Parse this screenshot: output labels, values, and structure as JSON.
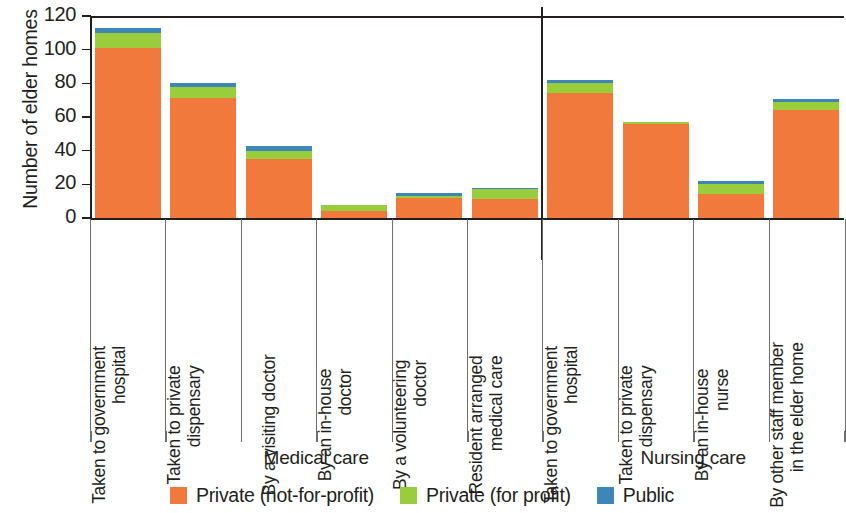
{
  "chart_data": {
    "type": "bar",
    "subtype": "stacked-bar",
    "title": "",
    "xlabel": "",
    "ylabel": "Number of elder homes",
    "ylim": [
      0,
      120
    ],
    "yticks": [
      0,
      20,
      40,
      60,
      80,
      100,
      120
    ],
    "grid": false,
    "legend_position": "bottom-center",
    "categories": [
      "Taken to government hospital",
      "Taken to private dispensary",
      "By a visiting doctor",
      "By an in-house doctor",
      "By a volunteering doctor",
      "Resident arranged medical care",
      "Taken to government hospital",
      "Taken to private dispensary",
      "By an in-house nurse",
      "By other staff member in the elder home"
    ],
    "category_lines": [
      [
        "Taken to government",
        "hospital"
      ],
      [
        "Taken to private",
        "dispensary"
      ],
      [
        "By a visiting doctor"
      ],
      [
        "By an in-house",
        "doctor"
      ],
      [
        "By a volunteering",
        "doctor"
      ],
      [
        "Resident arranged",
        "medical care"
      ],
      [
        "Taken to government",
        "hospital"
      ],
      [
        "Taken to private",
        "dispensary"
      ],
      [
        "By an in-house",
        "nurse"
      ],
      [
        "By other staff member",
        "in the elder home"
      ]
    ],
    "groups": [
      {
        "label": "Medical care",
        "start": 0,
        "end": 5
      },
      {
        "label": "Nursing care",
        "start": 6,
        "end": 9
      }
    ],
    "series": [
      {
        "name": "Private (not-for-profit)",
        "color": "#f2793c",
        "values": [
          101,
          71,
          35,
          4,
          12,
          11,
          74,
          56,
          14,
          64
        ]
      },
      {
        "name": "Private (for profit)",
        "color": "#9acd3c",
        "values": [
          9,
          7,
          5,
          4,
          1,
          6,
          6,
          1,
          6,
          5
        ]
      },
      {
        "name": "Public",
        "color": "#3d87b8",
        "values": [
          3,
          2,
          3,
          0,
          2,
          1,
          2,
          0,
          2,
          2
        ]
      }
    ],
    "totals": [
      113,
      80,
      43,
      8,
      15,
      18,
      82,
      57,
      22,
      71
    ]
  },
  "legend": {
    "items": [
      {
        "label": "Private (not-for-profit)",
        "color": "#f2793c",
        "swatch": "legend-swatch-orange"
      },
      {
        "label": "Private (for profit)",
        "color": "#9acd3c",
        "swatch": "legend-swatch-green"
      },
      {
        "label": "Public",
        "color": "#3d87b8",
        "swatch": "legend-swatch-blue"
      }
    ]
  }
}
